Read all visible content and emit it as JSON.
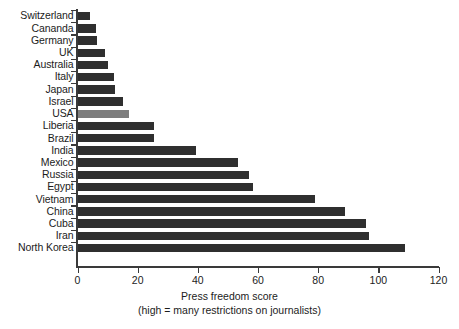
{
  "chart_data": {
    "type": "bar",
    "orientation": "horizontal",
    "title": "",
    "xlabel": "Press freedom score",
    "xlabel_sub": "(high = many restrictions on journalists)",
    "ylabel": "",
    "xlim": [
      0,
      120
    ],
    "xticks": [
      0,
      20,
      40,
      60,
      80,
      100,
      120
    ],
    "grid": false,
    "legend": false,
    "bar_color": "#2f2f2f",
    "highlight_color": "#7d7d7d",
    "highlight_category": "USA",
    "categories": [
      "Switzerland",
      "Cananda",
      "Germany",
      "UK",
      "Australia",
      "Italy",
      "Japan",
      "Israel",
      "USA",
      "Liberia",
      "Brazil",
      "India",
      "Mexico",
      "Russia",
      "Egypt",
      "Vietnam",
      "China",
      "Cuba",
      "Iran",
      "North Korea"
    ],
    "values": [
      4,
      6,
      6.5,
      9,
      10,
      12,
      12.5,
      15,
      17,
      25.5,
      25.5,
      39.5,
      53.5,
      57,
      58.5,
      79,
      89,
      96,
      97,
      109
    ]
  }
}
